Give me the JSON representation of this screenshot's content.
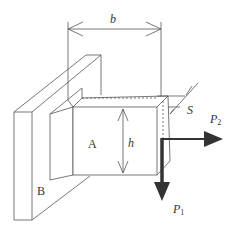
{
  "figure": {
    "labels": {
      "b": "b",
      "h": "h",
      "s": "S",
      "a": "A",
      "plate_b": "B",
      "p1_main": "P",
      "p1_sub": "1",
      "p2_main": "P",
      "p2_sub": "2"
    },
    "colors": {
      "line": "#555555",
      "arrow": "#333333",
      "background": "#ffffff"
    }
  }
}
